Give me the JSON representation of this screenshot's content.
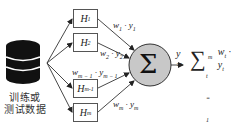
{
  "diagram": {
    "source_label": [
      "训练或",
      "测试数据"
    ],
    "hypotheses": [
      {
        "name": "H",
        "sub": "1"
      },
      {
        "name": "H",
        "sub": "2"
      },
      {
        "name": "H",
        "sub": "m-1"
      },
      {
        "name": "H",
        "sub": "m"
      }
    ],
    "weights": [
      {
        "w": "w",
        "wsub": "1",
        "dot": " · ",
        "y": "y",
        "ysub": "1"
      },
      {
        "w": "w",
        "wsub": "2",
        "dot": " · ",
        "y": "y",
        "ysub": "2"
      },
      {
        "w": "w",
        "wsub": "m − 1",
        "dot": " · ",
        "y": "y",
        "ysub": "m − 1"
      },
      {
        "w": "w",
        "wsub": "m",
        "dot": " · ",
        "y": "y",
        "ysub": "m"
      }
    ],
    "aggregator_symbol": "Σ",
    "output_formula": {
      "lhs": "y =",
      "sum": "∑",
      "upper": "m",
      "lower": "t = 1",
      "w": "w",
      "wsub": "t",
      "dot": " · ",
      "y": "y",
      "ysub": "t"
    },
    "colors": {
      "aggregator_fill": "#c8c8c8",
      "stroke": "#333333",
      "database": "#111111"
    }
  }
}
